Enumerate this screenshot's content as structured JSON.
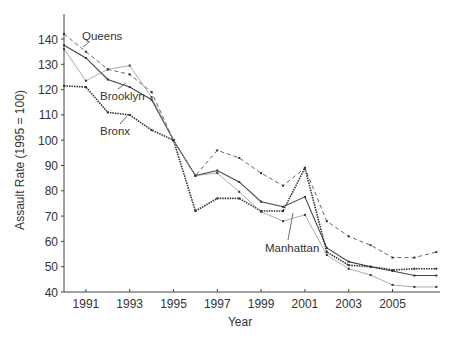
{
  "chart_data": {
    "type": "line",
    "title": "",
    "xlabel": "Year",
    "ylabel": "Assault Rate (1995 = 100)",
    "xlim": [
      1990,
      2007
    ],
    "ylim": [
      40,
      145
    ],
    "x_ticks": [
      1991,
      1993,
      1995,
      1997,
      1999,
      2001,
      2003,
      2005
    ],
    "y_ticks": [
      40,
      50,
      60,
      70,
      80,
      90,
      100,
      110,
      120,
      130,
      140
    ],
    "grid": false,
    "legend": "inline labels",
    "x": [
      1990,
      1991,
      1992,
      1993,
      1994,
      1995,
      1996,
      1997,
      1998,
      1999,
      2000,
      2001,
      2002,
      2003,
      2004,
      2005,
      2006,
      2007
    ],
    "series": [
      {
        "name": "Queens",
        "style": "dashed",
        "color": "#555555",
        "values": [
          142,
          135,
          128,
          126,
          119,
          100,
          86,
          96,
          93,
          87,
          82,
          89,
          68,
          62,
          58.5,
          53.6,
          53.6,
          55.8
        ]
      },
      {
        "name": "Brooklyn",
        "style": "solid",
        "color": "#333333",
        "values": [
          137.5,
          132.5,
          124,
          121,
          116,
          100,
          86,
          88,
          83.5,
          75.7,
          73.7,
          77.6,
          57.4,
          52,
          50,
          48.3,
          46.5,
          46.5
        ]
      },
      {
        "name": "Bronx",
        "style": "dotted-heavy",
        "color": "#222222",
        "values": [
          121.5,
          121,
          111,
          110,
          104,
          100,
          72,
          77,
          77,
          72,
          72,
          89,
          55.8,
          50.6,
          50,
          48.7,
          49.2,
          49.2
        ]
      },
      {
        "name": "Manhattan",
        "style": "thin",
        "color": "#888888",
        "values": [
          136,
          123.5,
          128,
          129.5,
          117,
          100,
          86,
          87,
          79.6,
          71.7,
          68,
          70.5,
          54.6,
          49.2,
          46.7,
          42.8,
          42,
          42
        ]
      }
    ]
  },
  "labels": {
    "queens": "Queens",
    "brooklyn": "Brooklyn",
    "bronx": "Bronx",
    "manhattan": "Manhattan",
    "xlabel": "Year",
    "ylabel": "Assault Rate (1995 = 100)"
  },
  "ticks": {
    "x": [
      "1991",
      "1993",
      "1995",
      "1997",
      "1999",
      "2001",
      "2003",
      "2005"
    ],
    "y": [
      "40",
      "50",
      "60",
      "70",
      "80",
      "90",
      "100",
      "110",
      "120",
      "130",
      "140"
    ]
  }
}
